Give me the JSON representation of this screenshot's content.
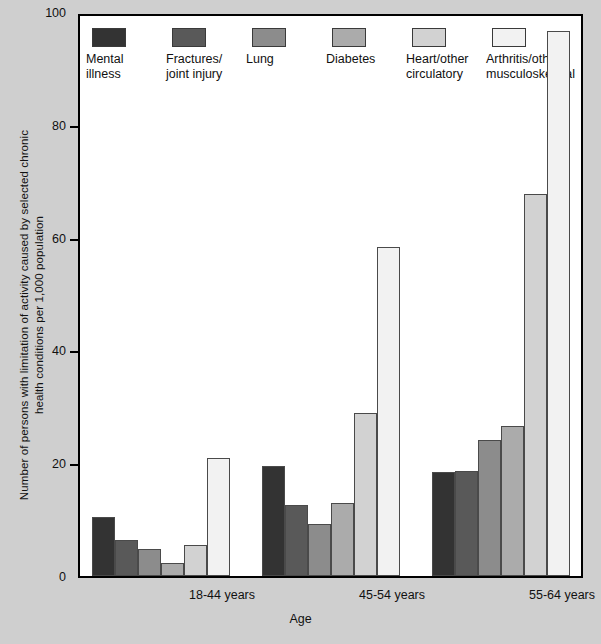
{
  "chart_data": {
    "type": "bar",
    "title": "",
    "xlabel": "Age",
    "ylabel": "Number of persons with limitation of activity caused by selected chronic\nhealth conditions  per 1,000 population",
    "categories": [
      "18-44 years",
      "45-54 years",
      "55-64 years"
    ],
    "series": [
      {
        "name": "Mental\nillness",
        "color": "#333333",
        "values": [
          10.6,
          19.7,
          18.5
        ]
      },
      {
        "name": "Fractures/\njoint injury",
        "color": "#595959",
        "values": [
          6.4,
          12.7,
          18.8
        ]
      },
      {
        "name": "Lung",
        "color": "#8c8c8c",
        "values": [
          4.8,
          9.3,
          24.2
        ]
      },
      {
        "name": "Diabetes",
        "color": "#ababab",
        "values": [
          2.4,
          13.1,
          26.7
        ]
      },
      {
        "name": "Heart/other\ncirculatory",
        "color": "#d2d2d2",
        "values": [
          5.6,
          29.1,
          68.3
        ]
      },
      {
        "name": "Arthritis/other\nmusculoskeletal",
        "color": "#f2f2f2",
        "values": [
          21.0,
          58.7,
          97.4
        ]
      }
    ],
    "ylim": [
      0,
      100
    ],
    "yticks": [
      "0",
      "20",
      "40",
      "60",
      "80",
      "100"
    ],
    "grid": false,
    "legend_position": "inside-top-left"
  }
}
